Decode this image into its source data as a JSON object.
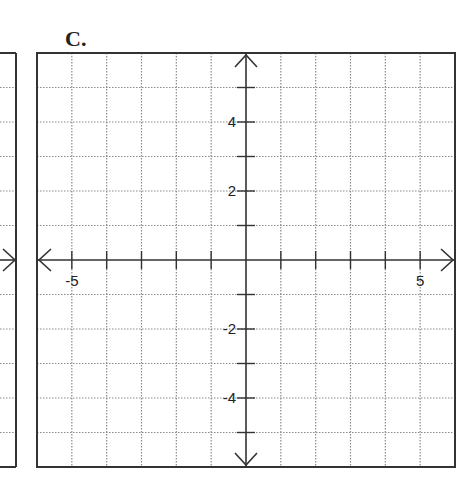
{
  "panel_label": "C.",
  "chart_data": {
    "type": "coordinate-grid",
    "title": "C.",
    "xlabel": "",
    "ylabel": "",
    "xlim": [
      -6,
      6
    ],
    "ylim": [
      -6,
      6
    ],
    "grid": true,
    "grid_style": "dotted",
    "grid_step": 1,
    "x_ticks": [
      -5,
      -4,
      -3,
      -2,
      -1,
      1,
      2,
      3,
      4,
      5
    ],
    "y_ticks": [
      -5,
      -4,
      -3,
      -2,
      -1,
      1,
      2,
      3,
      4,
      5
    ],
    "x_tick_labels": [
      {
        "value": -5,
        "text": "-5"
      },
      {
        "value": 5,
        "text": "5"
      }
    ],
    "y_tick_labels": [
      {
        "value": 4,
        "text": "4"
      },
      {
        "value": 2,
        "text": "2"
      },
      {
        "value": -2,
        "text": "-2"
      },
      {
        "value": -4,
        "text": "-4"
      }
    ],
    "axes_arrows": true,
    "series": []
  },
  "colors": {
    "border": "#333333",
    "axis": "#333333",
    "grid": "#8a8a8a",
    "text": "#222222",
    "background": "#ffffff"
  }
}
